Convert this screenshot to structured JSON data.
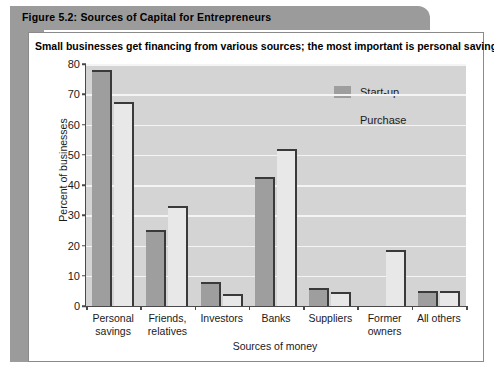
{
  "figure": {
    "title": "Figure 5.2: Sources of Capital for Entrepreneurs",
    "subtitle": "Small businesses get financing from various sources; the most important is personal savings."
  },
  "colors": {
    "banner": "#9b9b9b",
    "plot_background": "#d4d4d4",
    "gridline": "#f4f4f4",
    "startup_bar": "#9e9e9e",
    "purchase_bar": "#e8e8e8",
    "bar_outline": "#3a3a3a",
    "axis": "#4a4a4a",
    "card": "#ffffff"
  },
  "chart_data": {
    "type": "bar",
    "title": "Small businesses get financing from various sources; the most important is personal savings.",
    "xlabel": "Sources of money",
    "ylabel": "Percent of businesses",
    "ylim": [
      0,
      80
    ],
    "yticks": [
      0,
      10,
      20,
      30,
      40,
      50,
      60,
      70,
      80
    ],
    "grid": true,
    "legend_position": "top-right",
    "categories": [
      "Personal savings",
      "Friends, relatives",
      "Investors",
      "Banks",
      "Suppliers",
      "Former owners",
      "All others"
    ],
    "category_lines": [
      [
        "Personal",
        "savings"
      ],
      [
        "Friends,",
        "relatives"
      ],
      [
        "Investors",
        ""
      ],
      [
        "Banks",
        ""
      ],
      [
        "Suppliers",
        ""
      ],
      [
        "Former",
        "owners"
      ],
      [
        "All others",
        ""
      ]
    ],
    "series": [
      {
        "name": "Start-up",
        "values": [
          78,
          25,
          8,
          42.5,
          6,
          0,
          5
        ]
      },
      {
        "name": "Purchase",
        "values": [
          67.5,
          33,
          4,
          52,
          4.5,
          18.5,
          5
        ]
      }
    ]
  }
}
